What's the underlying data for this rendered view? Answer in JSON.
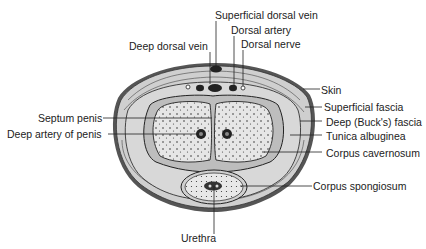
{
  "diagram": {
    "type": "anatomical cross-section",
    "labels": {
      "superficial_dorsal_vein": "Superficial dorsal vein",
      "dorsal_artery": "Dorsal artery",
      "deep_dorsal_vein": "Deep dorsal vein",
      "dorsal_nerve": "Dorsal nerve",
      "skin": "Skin",
      "superficial_fascia": "Superficial fascia",
      "septum_penis": "Septum penis",
      "deep_bucks_fascia": "Deep (Buck's) fascia",
      "deep_artery": "Deep artery of penis",
      "tunica_albuginea": "Tunica albuginea",
      "corpus_cavernosum": "Corpus cavernosum",
      "corpus_spongiosum": "Corpus spongiosum",
      "urethra": "Urethra"
    }
  }
}
